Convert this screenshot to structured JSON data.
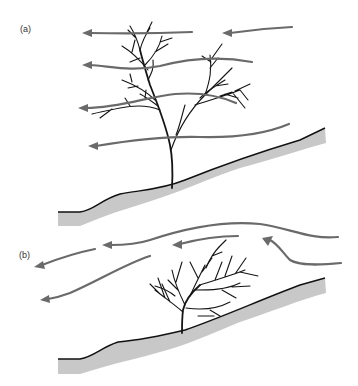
{
  "figure": {
    "panels": [
      {
        "id": "a",
        "label": "(a)",
        "description": "Tall open-crowned tree on slope; wind passes through the crown"
      },
      {
        "id": "b",
        "label": "(b)",
        "description": "Dense wind-shaped shrub on slope; wind deflected over and around it"
      }
    ]
  },
  "colors": {
    "arrow": "#6a6a6a",
    "ground_fill": "#c8c8c8",
    "outline": "#111111",
    "background": "#ffffff"
  }
}
